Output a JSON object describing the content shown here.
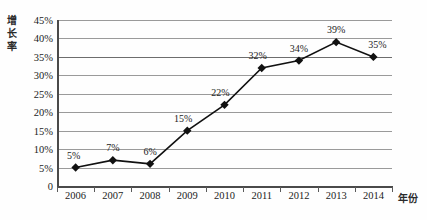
{
  "chart_data": {
    "type": "line",
    "title": "",
    "xlabel": "年份",
    "ylabel": "增长率",
    "ylabel_chars": [
      "增",
      "长",
      "率"
    ],
    "categories": [
      "2006",
      "2007",
      "2008",
      "2009",
      "2010",
      "2011",
      "2012",
      "2013",
      "2014"
    ],
    "values": [
      5,
      7,
      6,
      15,
      22,
      32,
      34,
      39,
      35
    ],
    "point_labels": [
      "5%",
      "7%",
      "6%",
      "15%",
      "22%",
      "32%",
      "34%",
      "39%",
      "35%"
    ],
    "ylim": [
      0,
      45
    ],
    "ytick_values": [
      0,
      5,
      10,
      15,
      20,
      25,
      30,
      35,
      40,
      45
    ],
    "ytick_labels": [
      "0",
      "5%",
      "10%",
      "15%",
      "20%",
      "25%",
      "30%",
      "35%",
      "40%",
      "45%"
    ],
    "grid": true,
    "legend": false,
    "marker": "diamond",
    "series": [
      {
        "name": "增长率",
        "values": [
          5,
          7,
          6,
          15,
          22,
          32,
          34,
          39,
          35
        ]
      }
    ],
    "colors": {
      "line": "#111111",
      "marker": "#111111",
      "grid": "#9a9a9a",
      "axis": "#4a4a4a",
      "text": "#1c1c1c",
      "background": "#fefefe"
    }
  }
}
